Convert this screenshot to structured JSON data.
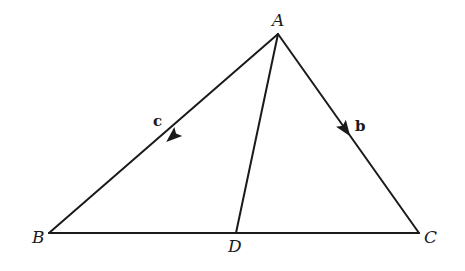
{
  "diagram": {
    "type": "triangle-with-cevian",
    "points": {
      "A": {
        "label": "A",
        "x": 278,
        "y": 34
      },
      "B": {
        "label": "B",
        "x": 49,
        "y": 233
      },
      "C": {
        "label": "C",
        "x": 419,
        "y": 233
      },
      "D": {
        "label": "D",
        "x": 236,
        "y": 233
      }
    },
    "segments": [
      {
        "from": "A",
        "to": "B",
        "vector_label": "c",
        "arrow_direction": "A-to-B"
      },
      {
        "from": "A",
        "to": "C",
        "vector_label": "b",
        "arrow_direction": "A-to-C"
      },
      {
        "from": "B",
        "to": "C"
      },
      {
        "from": "A",
        "to": "D"
      }
    ],
    "labels": {
      "vertex_a": "A",
      "vertex_b": "B",
      "vertex_c": "C",
      "point_d": "D",
      "vector_c": "c",
      "vector_b": "b"
    },
    "colors": {
      "stroke": "#1a1a1a",
      "background": "#ffffff"
    }
  }
}
